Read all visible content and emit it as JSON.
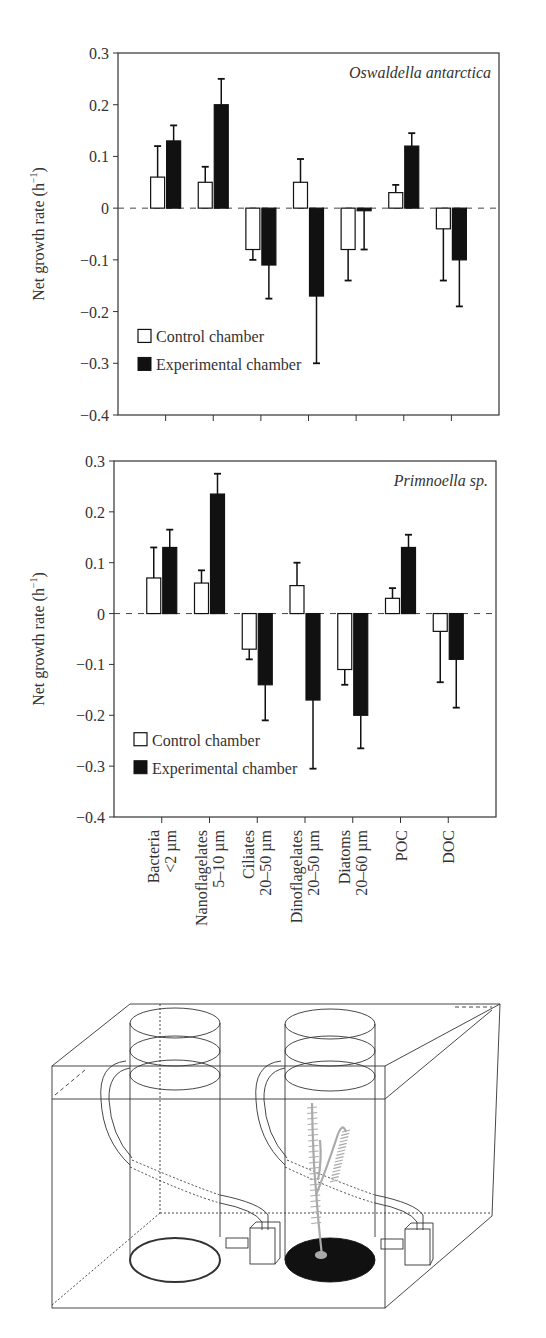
{
  "figure": {
    "y_axis_label": "Net growth rate (h",
    "y_axis_label_sup": "−1",
    "y_axis_label_close": ")",
    "y_ticks": [
      "0.3",
      "0.2",
      "0.1",
      "0",
      "−0.1",
      "−0.2",
      "−0.3",
      "−0.4"
    ],
    "legend": {
      "control": "Control chamber",
      "experimental": "Experimental chamber"
    },
    "x_labels": [
      [
        "Bacteria",
        "<2 µm"
      ],
      [
        "Nanoflagelates",
        "5–10 µm"
      ],
      [
        "Ciliates",
        "20–50 µm"
      ],
      [
        "Dinoflagelates",
        "20–50 µm"
      ],
      [
        "Diatoms",
        "20–60 µm"
      ],
      [
        "POC"
      ],
      [
        "DOC"
      ]
    ],
    "diagram_caption": ""
  },
  "chart_data": [
    {
      "type": "bar",
      "title": "Oswaldella antarctica",
      "xlabel": "",
      "ylabel": "Net growth rate (h−1)",
      "ylim": [
        -0.4,
        0.3
      ],
      "grid": false,
      "legend_position": "lower-left",
      "categories": [
        "Bacteria <2 µm",
        "Nanoflagelates 5–10 µm",
        "Ciliates 20–50 µm",
        "Dinoflagelates 20–50 µm",
        "Diatoms 20–60 µm",
        "POC",
        "DOC"
      ],
      "series": [
        {
          "name": "Control chamber",
          "values": [
            0.06,
            0.05,
            -0.08,
            0.05,
            -0.08,
            0.03,
            -0.04
          ],
          "error": [
            0.06,
            0.03,
            0.02,
            0.045,
            0.06,
            0.015,
            0.1
          ]
        },
        {
          "name": "Experimental chamber",
          "values": [
            0.13,
            0.2,
            -0.11,
            -0.17,
            -0.005,
            0.12,
            -0.1
          ],
          "error": [
            0.03,
            0.05,
            0.065,
            0.13,
            0.075,
            0.025,
            0.09
          ]
        }
      ]
    },
    {
      "type": "bar",
      "title": "Primnoella sp.",
      "xlabel": "",
      "ylabel": "Net growth rate (h−1)",
      "ylim": [
        -0.4,
        0.3
      ],
      "grid": false,
      "legend_position": "lower-left",
      "categories": [
        "Bacteria <2 µm",
        "Nanoflagelates 5–10 µm",
        "Ciliates 20–50 µm",
        "Dinoflagelates 20–50 µm",
        "Diatoms 20–60 µm",
        "POC",
        "DOC"
      ],
      "series": [
        {
          "name": "Control chamber",
          "values": [
            0.07,
            0.06,
            -0.07,
            0.055,
            -0.11,
            0.03,
            -0.035
          ],
          "error": [
            0.06,
            0.025,
            0.02,
            0.045,
            0.03,
            0.02,
            0.1
          ]
        },
        {
          "name": "Experimental chamber",
          "values": [
            0.13,
            0.235,
            -0.14,
            -0.17,
            -0.2,
            0.13,
            -0.09
          ],
          "error": [
            0.035,
            0.04,
            0.07,
            0.135,
            0.065,
            0.025,
            0.095
          ]
        }
      ]
    }
  ]
}
